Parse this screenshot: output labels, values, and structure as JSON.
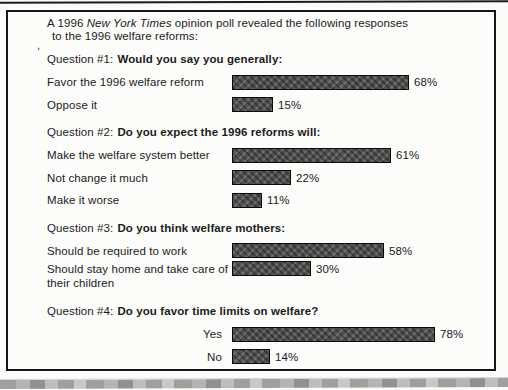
{
  "page": {
    "intro": {
      "pre_italic": "A 1996 ",
      "italic": "New York Times",
      "post_italic": " opinion poll revealed the following responses",
      "line2": "to the 1996 welfare reforms:",
      "stray_mark": ","
    },
    "bar_color": "#5c5c5c",
    "border_color": "#161616"
  },
  "chart_data": {
    "type": "bar",
    "orientation": "horizontal",
    "title": "A 1996 New York Times opinion poll revealed the following responses to the 1996 welfare reforms:",
    "unit": "percent",
    "value_labels_shown": true,
    "axes_shown": false,
    "legend": "none",
    "groups": [
      {
        "question_prefix": "Question #1:",
        "question_bold": "Would you say you generally:",
        "bars": [
          {
            "label": "Favor the 1996 welfare reform",
            "value": 68,
            "display": "68%"
          },
          {
            "label": "Oppose it",
            "value": 15,
            "display": "15%"
          }
        ]
      },
      {
        "question_prefix": "Question #2:",
        "question_bold": "Do you expect the 1996 reforms will:",
        "bars": [
          {
            "label": "Make the welfare system better",
            "value": 61,
            "display": "61%"
          },
          {
            "label": "Not change it much",
            "value": 22,
            "display": "22%"
          },
          {
            "label": "Make it worse",
            "value": 11,
            "display": "11%"
          }
        ]
      },
      {
        "question_prefix": "Question #3:",
        "question_bold": "Do you think welfare mothers:",
        "bars": [
          {
            "label": "Should be required to work",
            "value": 58,
            "display": "58%"
          },
          {
            "label": "Should stay home and take care of their children",
            "value": 30,
            "display": "30%",
            "two_line": true
          }
        ]
      },
      {
        "question_prefix": "Question #4:",
        "question_bold": "Do you favor time limits on welfare?",
        "right_labels": true,
        "bars": [
          {
            "label": "Yes",
            "value": 78,
            "display": "78%"
          },
          {
            "label": "No",
            "value": 14,
            "display": "14%"
          }
        ]
      }
    ]
  }
}
